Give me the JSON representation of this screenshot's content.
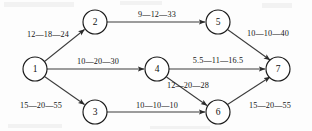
{
  "diagram": {
    "label_separator": "—",
    "colors": {
      "background": "#fdfdfd",
      "node_stroke": "#1a1a1a",
      "node_fill": "#ffffff",
      "edge_stroke": "#3c3c3c",
      "text": "#151515"
    },
    "nodes": [
      {
        "id": "1",
        "label": "1",
        "cx": 35,
        "cy": 69,
        "r": 12
      },
      {
        "id": "2",
        "label": "2",
        "cx": 95,
        "cy": 22,
        "r": 12
      },
      {
        "id": "3",
        "label": "3",
        "cx": 95,
        "cy": 112,
        "r": 12
      },
      {
        "id": "4",
        "label": "4",
        "cx": 157,
        "cy": 69,
        "r": 12
      },
      {
        "id": "5",
        "label": "5",
        "cx": 218,
        "cy": 22,
        "r": 12
      },
      {
        "id": "6",
        "label": "6",
        "cx": 218,
        "cy": 112,
        "r": 12
      },
      {
        "id": "7",
        "label": "7",
        "cx": 278,
        "cy": 69,
        "r": 12
      }
    ],
    "edges": [
      {
        "id": "edge-1-2",
        "from": "1",
        "to": "2",
        "label": "12—18—24",
        "estimates": {
          "optimistic": 12,
          "most_likely": 18,
          "pessimistic": 24
        },
        "label_x": 48,
        "label_y": 34
      },
      {
        "id": "edge-1-4",
        "from": "1",
        "to": "4",
        "label": "10—20—30",
        "estimates": {
          "optimistic": 10,
          "most_likely": 20,
          "pessimistic": 30
        },
        "label_x": 98,
        "label_y": 61
      },
      {
        "id": "edge-1-3",
        "from": "1",
        "to": "3",
        "label": "15—20—55",
        "estimates": {
          "optimistic": 15,
          "most_likely": 20,
          "pessimistic": 55
        },
        "label_x": 41,
        "label_y": 105
      },
      {
        "id": "edge-2-5",
        "from": "2",
        "to": "5",
        "label": "9—12—33",
        "estimates": {
          "optimistic": 9,
          "most_likely": 12,
          "pessimistic": 33
        },
        "label_x": 157,
        "label_y": 14
      },
      {
        "id": "edge-5-7",
        "from": "5",
        "to": "7",
        "label": "10—10—40",
        "estimates": {
          "optimistic": 10,
          "most_likely": 10,
          "pessimistic": 40
        },
        "label_x": 268,
        "label_y": 33
      },
      {
        "id": "edge-4-7",
        "from": "4",
        "to": "7",
        "label": "5.5—11—16.5",
        "estimates": {
          "optimistic": 5.5,
          "most_likely": 11,
          "pessimistic": 16.5
        },
        "label_x": 218,
        "label_y": 60
      },
      {
        "id": "edge-4-6",
        "from": "4",
        "to": "6",
        "label": "12—20—28",
        "estimates": {
          "optimistic": 12,
          "most_likely": 20,
          "pessimistic": 28
        },
        "label_x": 188,
        "label_y": 85
      },
      {
        "id": "edge-3-6",
        "from": "3",
        "to": "6",
        "label": "10—10—10",
        "estimates": {
          "optimistic": 10,
          "most_likely": 10,
          "pessimistic": 10
        },
        "label_x": 157,
        "label_y": 105
      },
      {
        "id": "edge-6-7",
        "from": "6",
        "to": "7",
        "label": "15—20—55",
        "estimates": {
          "optimistic": 15,
          "most_likely": 20,
          "pessimistic": 55
        },
        "label_x": 270,
        "label_y": 105
      }
    ]
  }
}
